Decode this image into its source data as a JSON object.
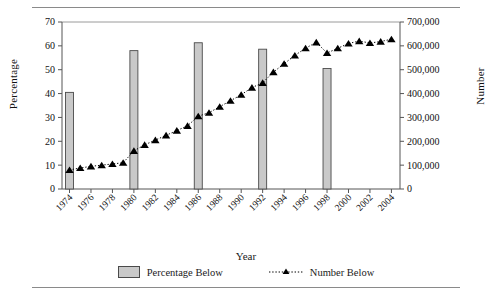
{
  "figure": {
    "has_top_rule": true,
    "has_bottom_rule": true
  },
  "chart_data": {
    "type": "bar",
    "title": "",
    "subtitle": "",
    "xlabel": "Year",
    "ylabel": "Percentage",
    "y2label": "Number",
    "grid": false,
    "legend_position": "bottom",
    "x": [
      1974,
      1975,
      1976,
      1977,
      1978,
      1979,
      1980,
      1981,
      1982,
      1983,
      1984,
      1985,
      1986,
      1987,
      1988,
      1989,
      1990,
      1991,
      1992,
      1993,
      1994,
      1995,
      1996,
      1997,
      1998,
      1999,
      2000,
      2001,
      2002,
      2003,
      2004
    ],
    "xtick_labels": [
      "1974",
      "1976",
      "1978",
      "1980",
      "1982",
      "1984",
      "1986",
      "1988",
      "1990",
      "1992",
      "1994",
      "1996",
      "1998",
      "2000",
      "2002",
      "2004"
    ],
    "xtick_values": [
      1974,
      1976,
      1978,
      1980,
      1982,
      1984,
      1986,
      1988,
      1990,
      1992,
      1994,
      1996,
      1998,
      2000,
      2002,
      2004
    ],
    "xlim": [
      1973.3,
      2004.8
    ],
    "ylim": [
      0,
      70
    ],
    "ytick_labels": [
      "0",
      "10",
      "20",
      "30",
      "40",
      "50",
      "60",
      "70"
    ],
    "ytick_values": [
      0,
      10,
      20,
      30,
      40,
      50,
      60,
      70
    ],
    "y2lim": [
      0,
      700000
    ],
    "y2tick_labels": [
      "0",
      "100,000",
      "200,000",
      "300,000",
      "400,000",
      "500,000",
      "600,000",
      "700,000"
    ],
    "y2tick_values": [
      0,
      100000,
      200000,
      300000,
      400000,
      500000,
      600000,
      700000
    ],
    "series": [
      {
        "name": "Percentage Below",
        "kind": "bar",
        "axis": "left",
        "color": "#c9c9c9",
        "edge_color": "#4a4a4a",
        "x": [
          1974,
          1980,
          1986,
          1992,
          1998
        ],
        "values": [
          40.5,
          58.0,
          61.3,
          58.6,
          50.5
        ]
      },
      {
        "name": "Number Below",
        "kind": "line",
        "axis": "right",
        "color": "#000000",
        "linestyle": "dotted",
        "marker": "triangle",
        "x": [
          1974,
          1975,
          1976,
          1977,
          1978,
          1979,
          1980,
          1981,
          1982,
          1983,
          1984,
          1985,
          1986,
          1987,
          1988,
          1989,
          1990,
          1991,
          1992,
          1993,
          1994,
          1995,
          1996,
          1997,
          1998,
          1999,
          2000,
          2001,
          2002,
          2003,
          2004
        ],
        "values": [
          80000,
          88000,
          95000,
          100000,
          105000,
          110000,
          160000,
          185000,
          205000,
          225000,
          245000,
          265000,
          305000,
          320000,
          345000,
          370000,
          395000,
          425000,
          445000,
          490000,
          525000,
          560000,
          590000,
          615000,
          570000,
          590000,
          610000,
          620000,
          612000,
          618000,
          628000
        ]
      }
    ]
  },
  "legend": {
    "items": [
      {
        "label": "Percentage Below",
        "type": "bar-swatch"
      },
      {
        "label": "Number Below",
        "type": "line-swatch"
      }
    ]
  }
}
